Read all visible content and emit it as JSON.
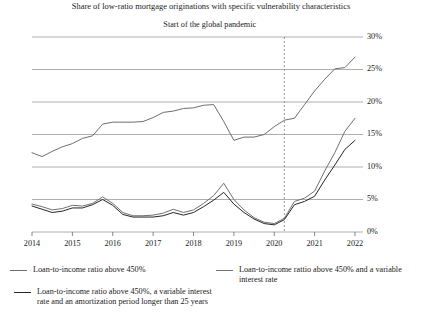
{
  "chart_data": {
    "type": "line",
    "title": "Share of low-ratio mortgage originations with specific vulnerability characteristics",
    "xlabel": "",
    "ylabel": "",
    "xlim": [
      2014,
      2022
    ],
    "ylim": [
      0,
      30
    ],
    "y_tick_labels": [
      "0%",
      "5%",
      "10%",
      "15%",
      "20%",
      "25%",
      "30%"
    ],
    "y_tick_values": [
      0,
      5,
      10,
      15,
      20,
      25,
      30
    ],
    "x_tick_labels": [
      "2014",
      "2015",
      "2016",
      "2017",
      "2018",
      "2019",
      "2020",
      "2021",
      "2022"
    ],
    "x_tick_values": [
      2014,
      2015,
      2016,
      2017,
      2018,
      2019,
      2020,
      2021,
      2022
    ],
    "grid": "horizontal",
    "legend_position": "bottom",
    "annotations": [
      {
        "text": "Start of the global pandemic",
        "x": 2020.25,
        "type": "vertical-dashed-line"
      }
    ],
    "series": [
      {
        "name": "Loan-to-income ratio above 450%",
        "color": "#6e6e6e",
        "x": [
          2014.0,
          2014.25,
          2014.5,
          2014.75,
          2015.0,
          2015.25,
          2015.5,
          2015.75,
          2016.0,
          2016.25,
          2016.5,
          2016.75,
          2017.0,
          2017.25,
          2017.5,
          2017.75,
          2018.0,
          2018.25,
          2018.5,
          2018.75,
          2019.0,
          2019.25,
          2019.5,
          2019.75,
          2020.0,
          2020.25,
          2020.5,
          2020.75,
          2021.0,
          2021.25,
          2021.5,
          2021.75,
          2022.0
        ],
        "values": [
          12.2,
          11.6,
          12.4,
          13.1,
          13.6,
          14.4,
          14.8,
          16.6,
          16.9,
          16.9,
          16.9,
          17.0,
          17.6,
          18.4,
          18.6,
          19.0,
          19.1,
          19.5,
          19.6,
          17.0,
          14.1,
          14.6,
          14.6,
          15.0,
          16.2,
          17.2,
          17.5,
          19.6,
          21.7,
          23.5,
          25.1,
          25.3,
          26.9
        ]
      },
      {
        "name": "Loan-to-income rattio above 450% and a variable interest rate",
        "color": "#707070",
        "x": [
          2014.0,
          2014.25,
          2014.5,
          2014.75,
          2015.0,
          2015.25,
          2015.5,
          2015.75,
          2016.0,
          2016.25,
          2016.5,
          2016.75,
          2017.0,
          2017.25,
          2017.5,
          2017.75,
          2018.0,
          2018.25,
          2018.5,
          2018.75,
          2019.0,
          2019.25,
          2019.5,
          2019.75,
          2020.0,
          2020.25,
          2020.5,
          2020.75,
          2021.0,
          2021.25,
          2021.5,
          2021.75,
          2022.0
        ],
        "values": [
          4.3,
          3.9,
          3.4,
          3.6,
          4.1,
          4.0,
          4.4,
          5.4,
          4.4,
          3.0,
          2.5,
          2.5,
          2.6,
          2.9,
          3.5,
          3.0,
          3.4,
          4.4,
          5.6,
          7.5,
          5.0,
          3.4,
          2.2,
          1.5,
          1.3,
          2.1,
          4.7,
          5.2,
          6.3,
          9.4,
          12.2,
          15.5,
          17.5
        ]
      },
      {
        "name": "Loan-to-income ratio above 450%,  a variable interest rate and an amortization period longer than 25 years",
        "color": "#262626",
        "x": [
          2014.0,
          2014.25,
          2014.5,
          2014.75,
          2015.0,
          2015.25,
          2015.5,
          2015.75,
          2016.0,
          2016.25,
          2016.5,
          2016.75,
          2017.0,
          2017.25,
          2017.5,
          2017.75,
          2018.0,
          2018.25,
          2018.5,
          2018.75,
          2019.0,
          2019.25,
          2019.5,
          2019.75,
          2020.0,
          2020.25,
          2020.5,
          2020.75,
          2021.0,
          2021.25,
          2021.5,
          2021.75,
          2022.0
        ],
        "values": [
          4.0,
          3.5,
          3.0,
          3.2,
          3.7,
          3.7,
          4.2,
          5.0,
          4.1,
          2.7,
          2.3,
          2.3,
          2.3,
          2.5,
          3.0,
          2.6,
          3.0,
          3.9,
          4.9,
          6.1,
          4.3,
          3.0,
          2.0,
          1.3,
          1.1,
          1.9,
          4.2,
          4.7,
          5.5,
          8.0,
          10.3,
          12.7,
          14.1
        ]
      }
    ]
  },
  "legend": {
    "items": [
      {
        "label": "Loan-to-income ratio above 450%"
      },
      {
        "label": "Loan-to-income rattio above 450% and a variable interest rate"
      },
      {
        "label": "Loan-to-income ratio above 450%,  a variable interest rate and an amortization period longer than 25 years"
      }
    ]
  }
}
